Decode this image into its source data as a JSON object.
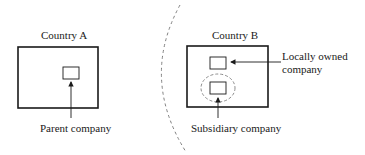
{
  "diagram": {
    "country_a": {
      "title": "Country A",
      "inner_label": "Parent company"
    },
    "country_b": {
      "title": "Country B",
      "local_label_line1": "Locally owned",
      "local_label_line2": "company",
      "subsidiary_label": "Subsidiary company"
    },
    "border": "dashed-arc",
    "colors": {
      "stroke": "#1a1a1a",
      "dashed": "#808080"
    }
  }
}
